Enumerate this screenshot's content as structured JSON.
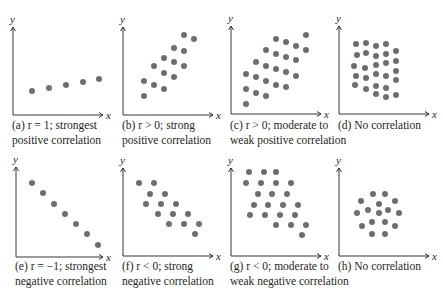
{
  "figure": {
    "dot_color": "#6d6e71",
    "axis_color": "#231f20",
    "axis_x_label": "x",
    "axis_y_label": "y"
  },
  "chart_data": [
    {
      "type": "scatter",
      "panel": "a",
      "caption_line1": "(a)  r = 1; strongest",
      "caption_line2": "positive correlation",
      "xlabel": "x",
      "ylabel": "y",
      "origin": [
        13,
        115
      ],
      "x_len": 90,
      "y_len": 88,
      "points": [
        [
          19,
          24
        ],
        [
          36,
          27
        ],
        [
          53,
          30
        ],
        [
          70,
          33
        ],
        [
          86,
          36
        ]
      ]
    },
    {
      "type": "scatter",
      "panel": "b",
      "caption_line1": "(b)  r > 0; strong",
      "caption_line2": "positive correlation",
      "xlabel": "x",
      "ylabel": "y",
      "origin": [
        123,
        115
      ],
      "x_len": 90,
      "y_len": 88,
      "points": [
        [
          21,
          19
        ],
        [
          21,
          34
        ],
        [
          31,
          30
        ],
        [
          31,
          49
        ],
        [
          41,
          26
        ],
        [
          41,
          42
        ],
        [
          41,
          57
        ],
        [
          51,
          38
        ],
        [
          51,
          53
        ],
        [
          51,
          67
        ],
        [
          61,
          49
        ],
        [
          61,
          64
        ],
        [
          61,
          80
        ],
        [
          71,
          76
        ]
      ]
    },
    {
      "type": "scatter",
      "panel": "c",
      "caption_line1": "(c)  r > 0; moderate to",
      "caption_line2": "weak positive correlation",
      "xlabel": "x",
      "ylabel": "y",
      "origin": [
        231,
        114
      ],
      "x_len": 90,
      "y_len": 88,
      "points": [
        [
          15,
          10
        ],
        [
          15,
          25
        ],
        [
          15,
          40
        ],
        [
          25,
          21
        ],
        [
          25,
          37
        ],
        [
          25,
          52
        ],
        [
          35,
          18
        ],
        [
          35,
          33
        ],
        [
          35,
          48
        ],
        [
          35,
          64
        ],
        [
          45,
          29
        ],
        [
          45,
          45
        ],
        [
          45,
          60
        ],
        [
          45,
          75
        ],
        [
          55,
          27
        ],
        [
          55,
          42
        ],
        [
          55,
          57
        ],
        [
          55,
          72
        ],
        [
          65,
          38
        ],
        [
          65,
          54
        ],
        [
          65,
          68
        ],
        [
          75,
          64
        ],
        [
          75,
          79
        ]
      ]
    },
    {
      "type": "scatter",
      "panel": "d",
      "caption_line1": "(d)  No correlation",
      "caption_line2": "",
      "xlabel": "x",
      "ylabel": "y",
      "origin": [
        339,
        114
      ],
      "x_len": 90,
      "y_len": 88,
      "points": [
        [
          17,
          70
        ],
        [
          27,
          71
        ],
        [
          37,
          68
        ],
        [
          47,
          70
        ],
        [
          18,
          59
        ],
        [
          27,
          61
        ],
        [
          37,
          58
        ],
        [
          47,
          60
        ],
        [
          57,
          63
        ],
        [
          15,
          48
        ],
        [
          26,
          46
        ],
        [
          37,
          49
        ],
        [
          47,
          51
        ],
        [
          57,
          53
        ],
        [
          17,
          38
        ],
        [
          27,
          36
        ],
        [
          37,
          40
        ],
        [
          47,
          38
        ],
        [
          57,
          43
        ],
        [
          16,
          29
        ],
        [
          27,
          25
        ],
        [
          37,
          28
        ],
        [
          47,
          26
        ],
        [
          57,
          34
        ],
        [
          37,
          20
        ],
        [
          47,
          17
        ],
        [
          57,
          19
        ]
      ]
    },
    {
      "type": "scatter",
      "panel": "e",
      "caption_line1": "(e)  r = −1; strongest",
      "caption_line2": "negative correlation",
      "xlabel": "x",
      "ylabel": "y",
      "origin": [
        16,
        257
      ],
      "x_len": 87,
      "y_len": 90,
      "points": [
        [
          16,
          74
        ],
        [
          27,
          64
        ],
        [
          38,
          53
        ],
        [
          49,
          43
        ],
        [
          60,
          33
        ],
        [
          71,
          23
        ],
        [
          82,
          12
        ]
      ]
    },
    {
      "type": "scatter",
      "panel": "f",
      "caption_line1": "(f)  r < 0; strong",
      "caption_line2": "negative correlation",
      "xlabel": "x",
      "ylabel": "y",
      "origin": [
        123,
        256
      ],
      "x_len": 90,
      "y_len": 88,
      "points": [
        [
          16,
          73
        ],
        [
          31,
          73
        ],
        [
          27,
          62
        ],
        [
          42,
          62
        ],
        [
          23,
          52
        ],
        [
          38,
          52
        ],
        [
          53,
          52
        ],
        [
          35,
          42
        ],
        [
          50,
          42
        ],
        [
          65,
          42
        ],
        [
          46,
          32
        ],
        [
          61,
          32
        ],
        [
          76,
          32
        ],
        [
          72,
          22
        ]
      ]
    },
    {
      "type": "scatter",
      "panel": "g",
      "caption_line1": "(g)  r < 0; moderate to",
      "caption_line2": "weak negative correlation",
      "xlabel": "x",
      "ylabel": "y",
      "origin": [
        231,
        256
      ],
      "x_len": 90,
      "y_len": 88,
      "points": [
        [
          18,
          84
        ],
        [
          33,
          84
        ],
        [
          45,
          84
        ],
        [
          15,
          73
        ],
        [
          30,
          73
        ],
        [
          45,
          73
        ],
        [
          60,
          73
        ],
        [
          27,
          62
        ],
        [
          41,
          62
        ],
        [
          56,
          62
        ],
        [
          23,
          51
        ],
        [
          37,
          51
        ],
        [
          52,
          51
        ],
        [
          67,
          51
        ],
        [
          19,
          41
        ],
        [
          34,
          41
        ],
        [
          49,
          41
        ],
        [
          64,
          41
        ],
        [
          45,
          31
        ],
        [
          60,
          31
        ],
        [
          75,
          31
        ],
        [
          71,
          21
        ]
      ]
    },
    {
      "type": "scatter",
      "panel": "h",
      "caption_line1": "(h)  No correlation",
      "caption_line2": "",
      "xlabel": "x",
      "ylabel": "y",
      "origin": [
        339,
        256
      ],
      "x_len": 90,
      "y_len": 88,
      "points": [
        [
          34,
          62
        ],
        [
          46,
          62
        ],
        [
          22,
          55
        ],
        [
          40,
          52
        ],
        [
          56,
          55
        ],
        [
          18,
          43
        ],
        [
          29,
          46
        ],
        [
          40,
          43
        ],
        [
          49,
          46
        ],
        [
          60,
          43
        ],
        [
          23,
          30
        ],
        [
          33,
          34
        ],
        [
          46,
          34
        ],
        [
          56,
          30
        ],
        [
          33,
          22
        ],
        [
          46,
          22
        ]
      ]
    }
  ]
}
